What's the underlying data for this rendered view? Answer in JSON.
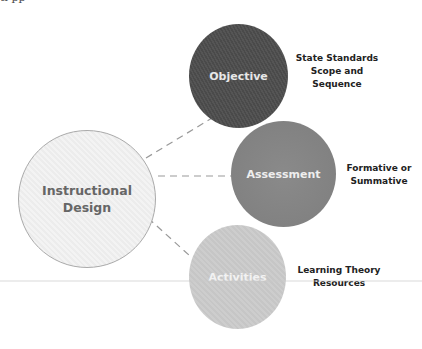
{
  "top_fragment": "   tl          pp",
  "diagram": {
    "center": {
      "label_line1": "Instructional",
      "label_line2": "Design"
    },
    "nodes": [
      {
        "label": "Objective",
        "note_line1": "State Standards",
        "note_line2": "Scope and",
        "note_line3": "Sequence",
        "color": "#4f4f4f"
      },
      {
        "label": "Assessment",
        "note_line1": "Formative or",
        "note_line2": "Summative",
        "color": "#828282"
      },
      {
        "label": "Activities",
        "note_line1": "Learning Theory",
        "note_line2": "Resources",
        "color": "#cacaca"
      }
    ],
    "center_color": "#efefef",
    "connector_style": "dashed",
    "connector_color": "#999999"
  }
}
